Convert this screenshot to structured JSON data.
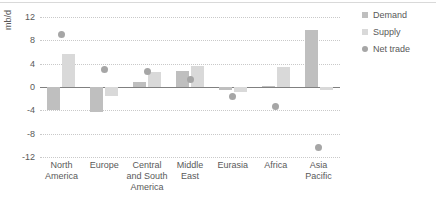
{
  "chart_data": {
    "type": "bar",
    "title": "",
    "xlabel": "",
    "ylabel": "mb/d",
    "ylim": [
      -12,
      12
    ],
    "yticks": [
      12,
      8,
      4,
      0,
      -4,
      -8,
      -12
    ],
    "ytick_labels": [
      "12",
      "8",
      "4",
      "0",
      "-4",
      "-8",
      "-12"
    ],
    "grid": true,
    "legend_position": "right",
    "categories": [
      "North America",
      "Europe",
      "Central and South America",
      "Middle East",
      "Eurasia",
      "Africa",
      "Asia Pacific"
    ],
    "category_lines": [
      [
        "North",
        "America"
      ],
      [
        "Europe"
      ],
      [
        "Central",
        "and South",
        "America"
      ],
      [
        "Middle",
        "East"
      ],
      [
        "Eurasia"
      ],
      [
        "Africa"
      ],
      [
        "Asia",
        "Pacific"
      ]
    ],
    "series": [
      {
        "name": "Demand",
        "kind": "bar",
        "color": "#bfbfbf",
        "values": [
          -4.0,
          -4.2,
          0.8,
          2.8,
          -0.5,
          0.1,
          9.7
        ]
      },
      {
        "name": "Supply",
        "kind": "bar",
        "color": "#d9d9d9",
        "values": [
          5.6,
          -1.6,
          2.6,
          3.6,
          -0.9,
          3.4,
          -0.5
        ]
      },
      {
        "name": "Net trade",
        "kind": "scatter",
        "color": "#a6a6a6",
        "values": [
          9.0,
          3.0,
          2.6,
          1.3,
          -1.6,
          -3.3,
          -10.3
        ]
      }
    ]
  },
  "legend": {
    "items": [
      {
        "label": "Demand",
        "marker": "square-swatch-icon"
      },
      {
        "label": "Supply",
        "marker": "square-swatch-icon"
      },
      {
        "label": "Net trade",
        "marker": "circle-marker-icon"
      }
    ]
  }
}
